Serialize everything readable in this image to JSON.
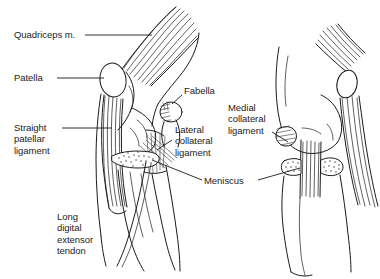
{
  "figure": {
    "kind": "anatomical-line-drawing",
    "background_color": "#ffffff",
    "ink_color": "#1a1a1a",
    "width": 380,
    "height": 279
  },
  "labels": [
    {
      "id": "quadriceps",
      "text": "Quadriceps m.",
      "x": 14,
      "y": 31,
      "leader": true,
      "view": "left-lateral"
    },
    {
      "id": "patella",
      "text": "Patella",
      "x": 14,
      "y": 74,
      "leader": true,
      "view": "left-lateral"
    },
    {
      "id": "straight-patellar-ligament",
      "text": "Straight\npatellar\nligament",
      "x": 14,
      "y": 124,
      "leader": true,
      "view": "left-lateral"
    },
    {
      "id": "long-digital-extensor-tendon",
      "text": "Long\ndigital\nextensor\ntendon",
      "x": 57,
      "y": 213,
      "leader": false,
      "view": "left-lateral"
    },
    {
      "id": "fabella",
      "text": "Fabella",
      "x": 184,
      "y": 87,
      "leader": true,
      "view": "left-lateral"
    },
    {
      "id": "lateral-collateral-ligament",
      "text": "Lateral\ncollateral\nligament",
      "x": 175,
      "y": 126,
      "leader": true,
      "view": "left-lateral"
    },
    {
      "id": "meniscus",
      "text": "Meniscus",
      "x": 204,
      "y": 177,
      "leader": true,
      "view": "both"
    },
    {
      "id": "medial-collateral-ligament",
      "text": "Medial\ncollateral\nligament",
      "x": 228,
      "y": 104,
      "leader": true,
      "view": "right-medial"
    }
  ],
  "views": [
    {
      "id": "left-lateral",
      "name": "Lateral view of left stifle"
    },
    {
      "id": "right-medial",
      "name": "Medial view of right stifle"
    }
  ]
}
